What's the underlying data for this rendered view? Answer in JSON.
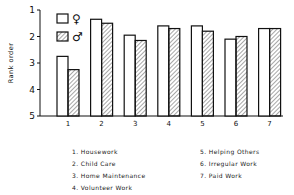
{
  "chart_data": {
    "type": "bar",
    "title": "",
    "xlabel": "",
    "ylabel": "Rank order",
    "ylim": [
      1,
      5
    ],
    "y_inverted": true,
    "y_ticks": [
      1,
      2,
      3,
      4,
      5
    ],
    "categories": [
      "1",
      "2",
      "3",
      "4",
      "5",
      "6",
      "7"
    ],
    "category_labels": [
      "Housework",
      "Child Care",
      "Home Maintenance",
      "Volunteer Work",
      "Helping Others",
      "Irregular Work",
      "Paid Work"
    ],
    "series": [
      {
        "name": "♀",
        "pattern": "open",
        "values": [
          2.75,
          1.35,
          1.95,
          1.6,
          1.6,
          2.1,
          1.7
        ]
      },
      {
        "name": "♂",
        "pattern": "hatched",
        "values": [
          3.25,
          1.5,
          2.15,
          1.7,
          1.8,
          2.0,
          1.7
        ]
      }
    ],
    "legend_position": "upper-left inside",
    "grid": false
  },
  "legend_list": {
    "left": [
      "1.  Housework",
      "2.  Child Care",
      "3.  Home Maintenance",
      "4.  Volunteer Work"
    ],
    "right": [
      "5.  Helping Others",
      "6.  Irregular Work",
      "7.  Paid Work"
    ]
  },
  "colors": {
    "ink": "#111111",
    "background": "#ffffff"
  }
}
